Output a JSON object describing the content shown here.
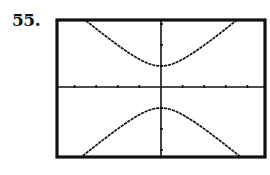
{
  "problem": {
    "number": "55."
  },
  "chart_data": {
    "type": "line",
    "title": "",
    "xlabel": "",
    "ylabel": "",
    "xlim": [
      -4.9,
      4.9
    ],
    "ylim": [
      -3.3,
      3.3
    ],
    "x_ticks": [
      -4,
      -3,
      -2,
      -1,
      1,
      2,
      3,
      4
    ],
    "y_ticks": [
      -3,
      -2,
      -1,
      1,
      2,
      3
    ],
    "tick_labels_shown": false,
    "grid": false,
    "legend": [],
    "series": [
      {
        "name": "upper branch",
        "x": [
          -3.5,
          -3,
          -2.5,
          -2,
          -1.5,
          -1,
          -0.5,
          0,
          0.5,
          1,
          1.5,
          2,
          2.5,
          3,
          3.5
        ],
        "y": [
          3.17,
          2.8,
          2.43,
          2.07,
          1.72,
          1.41,
          1.15,
          1.0,
          1.15,
          1.41,
          1.72,
          2.07,
          2.43,
          2.8,
          3.17
        ]
      },
      {
        "name": "lower branch",
        "x": [
          -3.5,
          -3,
          -2.5,
          -2,
          -1.5,
          -1,
          -0.5,
          0,
          0.5,
          1,
          1.5,
          2,
          2.5,
          3,
          3.5
        ],
        "y": [
          -3.17,
          -2.8,
          -2.43,
          -2.07,
          -1.72,
          -1.41,
          -1.15,
          -1.0,
          -1.15,
          -1.41,
          -1.72,
          -2.07,
          -2.43,
          -2.8,
          -3.17
        ]
      }
    ]
  },
  "layout": {
    "frame": {
      "left": 57,
      "top": 20,
      "right": 265,
      "bottom": 157
    },
    "origin_px": {
      "x": 161,
      "y": 87
    },
    "px_per_unit": {
      "x": 21.6,
      "y": 21.0
    },
    "colors": {
      "ink": "#111111",
      "background": "#ffffff"
    }
  }
}
